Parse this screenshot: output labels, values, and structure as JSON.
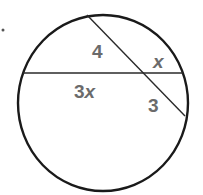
{
  "diagram": {
    "type": "intersecting-chords-in-circle",
    "colors": {
      "stroke": "#1a1a1a",
      "chord": "#2a2a2a",
      "label": "#6b6b6b",
      "background": "#ffffff"
    },
    "circle": {
      "cx": 103,
      "cy": 103,
      "rx": 85,
      "ry": 88
    },
    "chords": [
      {
        "name": "horizontal",
        "x1": 23,
        "y1": 73,
        "x2": 183,
        "y2": 73
      },
      {
        "name": "diagonal",
        "x1": 87,
        "y1": 15,
        "x2": 185,
        "y2": 116
      }
    ],
    "labels": {
      "upper_diagonal": "4",
      "right_horizontal": "x",
      "left_horizontal": "3x",
      "lower_diagonal": "3"
    },
    "marker_dot": "."
  }
}
